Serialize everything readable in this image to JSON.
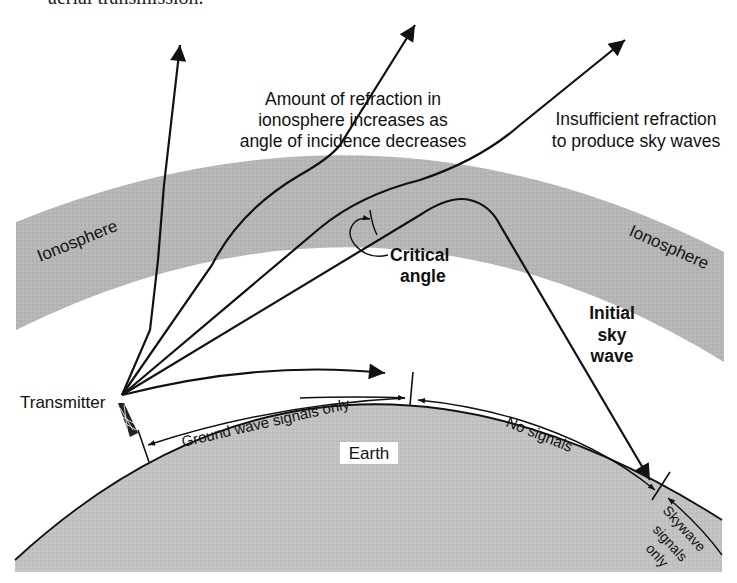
{
  "caption_fragment": "aerial transmission.",
  "colors": {
    "background": "#ffffff",
    "ionosphere_fill": "#b9b9b9",
    "earth_fill": "#c4c4c4",
    "line": "#111111",
    "earth_label_bg": "#ffffff"
  },
  "labels": {
    "refraction_note": [
      "Amount of refraction in",
      "ionosphere increases as",
      "angle of incidence decreases"
    ],
    "insufficient_note": [
      "Insufficient refraction",
      "to produce sky waves"
    ],
    "ionosphere_left": "Ionosphere",
    "ionosphere_right": "Ionosphere",
    "critical_angle": [
      "Critical",
      "angle"
    ],
    "initial_sky_wave": [
      "Initial",
      "sky",
      "wave"
    ],
    "transmitter": "Transmitter",
    "ground_wave_zone": "Ground wave signals only",
    "no_signals_zone": "No signals",
    "skywave_zone": [
      "Skywave",
      "signals",
      "only"
    ],
    "earth": "Earth"
  },
  "rays": [
    {
      "name": "near-vertical-ray",
      "escapes": true
    },
    {
      "name": "steep-ray",
      "escapes": true
    },
    {
      "name": "insufficient-refraction-ray",
      "escapes": true
    },
    {
      "name": "critical-sky-wave-ray",
      "escapes": false,
      "returns_to_earth": true
    },
    {
      "name": "ground-wave-ray",
      "escapes": false
    }
  ]
}
